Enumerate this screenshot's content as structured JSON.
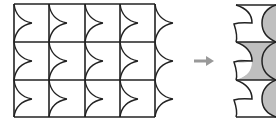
{
  "diagram": {
    "left_grid": {
      "rows": 3,
      "cols": 4,
      "stroke": "#222222"
    },
    "arrow": {
      "icon": "right-arrow-icon",
      "color": "#999999"
    },
    "right_pattern": {
      "shade_color": "#bfbfbf",
      "stroke": "#222222"
    }
  }
}
